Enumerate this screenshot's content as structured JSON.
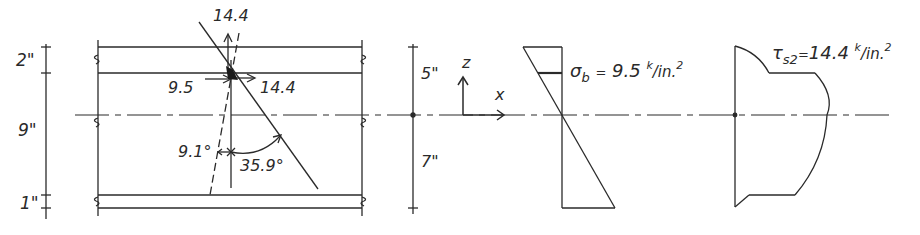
{
  "diagram": {
    "colors": {
      "ink": "#2a2a2a",
      "background": "#ffffff"
    },
    "section_dimensions": {
      "top_flange": "2\"",
      "web": "9\"",
      "bottom_flange": "1\""
    },
    "neutral_axis_dimensions": {
      "above": "5\"",
      "below": "7\""
    },
    "stress_element": {
      "normal_stress_label": "9.5",
      "shear_stress_horizontal_label": "14.4",
      "shear_stress_vertical_label": "14.4",
      "angle_small": "9.1°",
      "angle_large": "35.9°"
    },
    "axes": {
      "vertical": "z",
      "horizontal": "x"
    },
    "bending_stress": {
      "symbol": "σ",
      "subscript": "b",
      "equals": "=",
      "value": "9.5",
      "unit_k": "k",
      "unit_rest": "/in.",
      "exponent": "2"
    },
    "shear_stress": {
      "symbol": "τ",
      "subscript": "s2",
      "equals": "=",
      "value": "14.4",
      "unit_k": "k",
      "unit_rest": "/in.",
      "exponent": "2"
    }
  }
}
